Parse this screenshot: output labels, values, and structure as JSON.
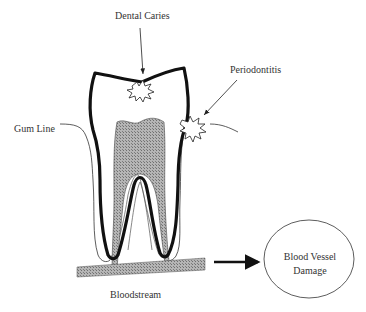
{
  "diagram": {
    "labels": {
      "dental_caries": "Dental Caries",
      "periodontitis": "Periodontitis",
      "gum_line": "Gum Line",
      "bloodstream": "Bloodstream",
      "outcome_line1": "Blood Vessel",
      "outcome_line2": "Damage"
    },
    "colors": {
      "outline": "#111111",
      "hatch_fill": "#9a9a9a",
      "text": "#333333",
      "background": "#ffffff"
    },
    "flow": [
      "Dental Caries",
      "Periodontitis",
      "Bloodstream",
      "Blood Vessel Damage"
    ]
  }
}
